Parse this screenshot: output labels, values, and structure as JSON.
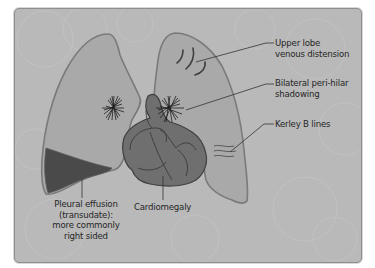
{
  "diagram": {
    "colors": {
      "panel_bg": "#b9b9b9",
      "lung_fill": "#a9a9a9",
      "lung_outline": "#7a7a7a",
      "heart_fill": "#6f6f6f",
      "heart_outline": "#3f3f3f",
      "effusion_fill": "#4a4a4a",
      "text": "#262626"
    },
    "labels": {
      "upper_lobe_line1": "Upper lobe",
      "upper_lobe_line2": "venous distension",
      "perihilar_line1": "Bilateral peri-hilar",
      "perihilar_line2": "shadowing",
      "kerley": "Kerley B lines",
      "effusion_line1": "Pleural effusion",
      "effusion_line2": "(transudate):",
      "effusion_line3": "more commonly",
      "effusion_line4": "right sided",
      "cardiomegaly": "Cardiomegaly"
    }
  }
}
